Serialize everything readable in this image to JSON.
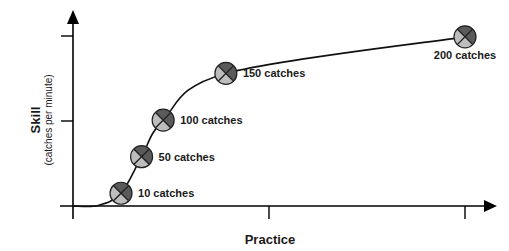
{
  "chart_data": {
    "type": "line",
    "title": "",
    "xlabel": "Practice",
    "ylabel": "Skill",
    "ylabel_sub": "(catches per minute)",
    "xlim": [
      0,
      2.1
    ],
    "ylim": [
      0,
      2.2
    ],
    "xticks": [
      1,
      2
    ],
    "yticks": [
      1,
      2
    ],
    "tick_labels_shown": false,
    "grid": false,
    "legend": "none",
    "series": [
      {
        "name": "learning curve",
        "points": [
          {
            "x": 0.245,
            "y": 0.15,
            "label": "10 catches"
          },
          {
            "x": 0.35,
            "y": 0.58,
            "label": "50 catches"
          },
          {
            "x": 0.46,
            "y": 1.01,
            "label": "100 catches"
          },
          {
            "x": 0.78,
            "y": 1.56,
            "label": "150 catches"
          },
          {
            "x": 2.0,
            "y": 1.99,
            "label": "200 catches"
          }
        ]
      }
    ],
    "curve_start": {
      "x": 0,
      "y": 0
    },
    "colors": {
      "axis": "#000000",
      "curve": "#111111",
      "marker_dark": "#5a5a5a",
      "marker_light": "#bdbdbd",
      "marker_outline": "#222222"
    }
  }
}
